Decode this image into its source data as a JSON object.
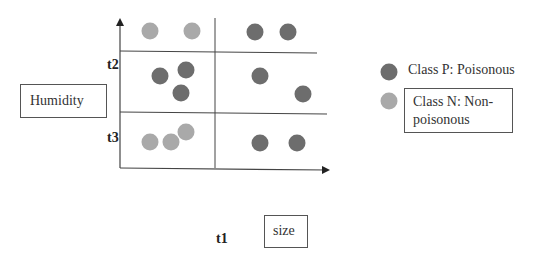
{
  "diagram": {
    "type": "decision-tree-partition-scatter",
    "y_axis_label": "Humidity",
    "x_axis_label": "size",
    "thresholds": {
      "x": "t1",
      "y_upper": "t2",
      "y_lower": "t3"
    },
    "points": [
      {
        "class": "N",
        "x": 150,
        "y": 31,
        "region": "top-left"
      },
      {
        "class": "N",
        "x": 192,
        "y": 31,
        "region": "top-left"
      },
      {
        "class": "P",
        "x": 255,
        "y": 32,
        "region": "top-right"
      },
      {
        "class": "P",
        "x": 288,
        "y": 32,
        "region": "top-right"
      },
      {
        "class": "P",
        "x": 160,
        "y": 76,
        "region": "middle-left"
      },
      {
        "class": "P",
        "x": 186,
        "y": 70,
        "region": "middle-left"
      },
      {
        "class": "P",
        "x": 181,
        "y": 93,
        "region": "middle-left"
      },
      {
        "class": "P",
        "x": 260,
        "y": 76,
        "region": "middle-right"
      },
      {
        "class": "P",
        "x": 303,
        "y": 94,
        "region": "middle-right"
      },
      {
        "class": "N",
        "x": 150,
        "y": 142,
        "region": "bottom-left"
      },
      {
        "class": "N",
        "x": 171,
        "y": 142,
        "region": "bottom-left"
      },
      {
        "class": "N",
        "x": 186,
        "y": 132,
        "region": "bottom-left"
      },
      {
        "class": "P",
        "x": 260,
        "y": 143,
        "region": "bottom-right"
      },
      {
        "class": "P",
        "x": 297,
        "y": 143,
        "region": "bottom-right"
      }
    ]
  },
  "legend": {
    "items": [
      {
        "class": "P",
        "label": "Class P: Poisonous",
        "color": "#6d6d6d"
      },
      {
        "class": "N",
        "label_line1": "Class N: Non-",
        "label_line2": "poisonous",
        "color": "#a9a9a9"
      }
    ]
  },
  "colors": {
    "poisonous": "#6d6d6d",
    "non_poisonous": "#a9a9a9",
    "axis": "#444444"
  }
}
